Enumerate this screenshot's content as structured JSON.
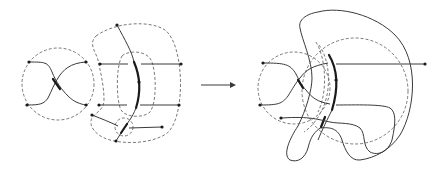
{
  "figure": {
    "left_panel": {
      "label": "before",
      "regions": [
        "crossing-circle",
        "crescent-region",
        "inner-oval",
        "small-circle"
      ]
    },
    "arrow": {
      "direction": "right",
      "icon": "arrow-right-icon"
    },
    "right_panel": {
      "label": "after",
      "regions": [
        "crossing-circle",
        "large-dashed-circle",
        "solid-kidney-boundary"
      ]
    }
  },
  "colors": {
    "stroke": "#3a3a3a",
    "dash": "#6a6a6a",
    "background": "#ffffff"
  }
}
